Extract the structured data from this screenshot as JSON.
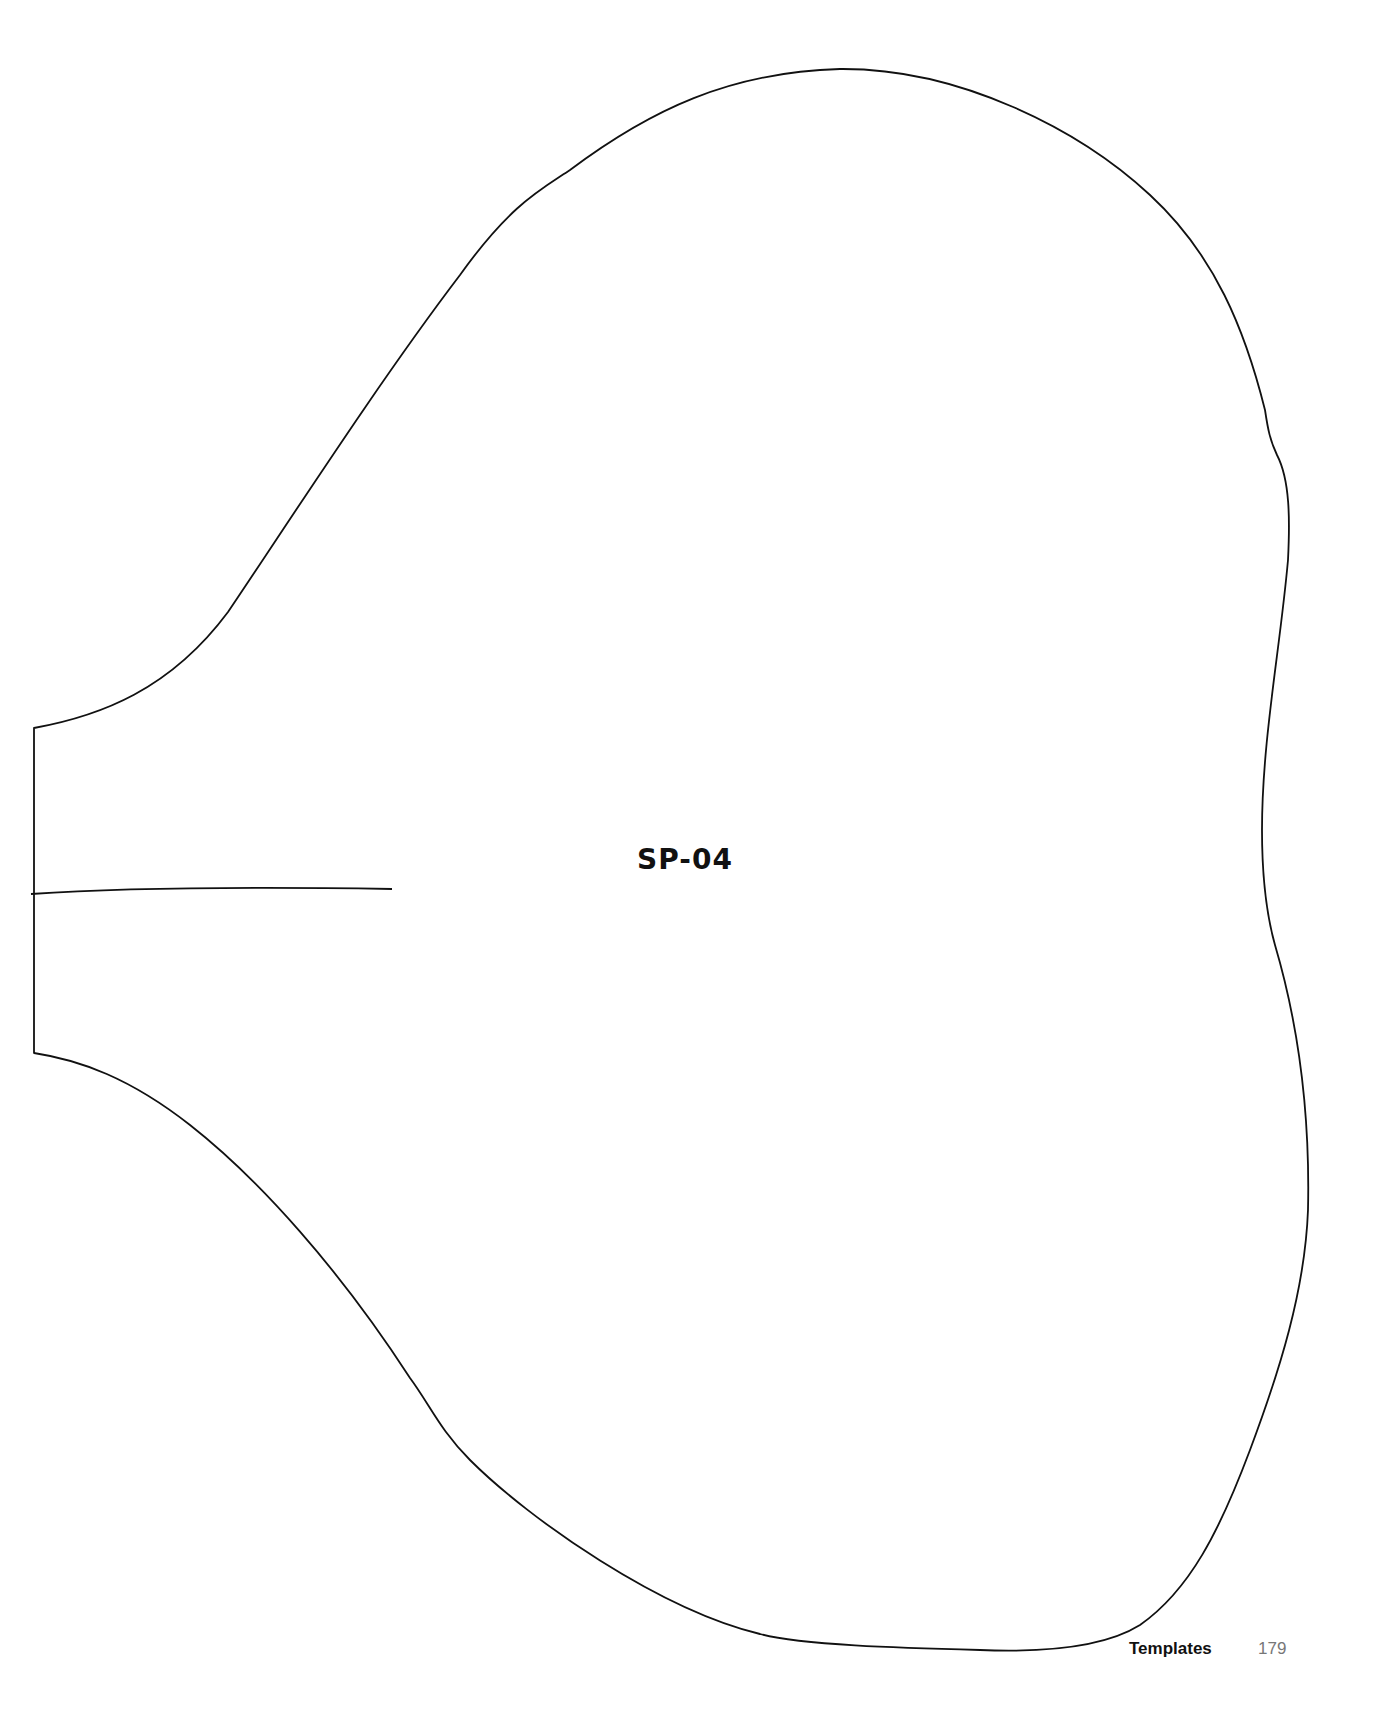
{
  "template": {
    "piece_id": "SP-04",
    "outline_color": "#111111",
    "outline_description": "Sleeve pattern piece outline with notched straight left edge and placement line"
  },
  "footer": {
    "section": "Templates",
    "page_number": "179"
  }
}
